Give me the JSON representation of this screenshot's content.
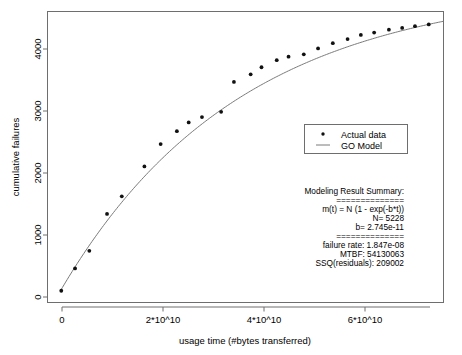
{
  "chart_data": {
    "type": "scatter",
    "title": "",
    "xlabel": "usage time (#bytes transferred)",
    "ylabel": "cumulative failures",
    "xlim": [
      -2500000000,
      78000000000
    ],
    "ylim": [
      -180,
      4780
    ],
    "grid": false,
    "legend_position": "center-right",
    "xticks": [
      0,
      20000000000,
      40000000000,
      60000000000
    ],
    "xtick_labels": [
      "0",
      "2*10^10",
      "4*10^10",
      "6*10^10"
    ],
    "yticks": [
      0,
      1000,
      2000,
      3000,
      4000
    ],
    "ytick_labels": [
      "0",
      "1000",
      "2000",
      "3000",
      "4000"
    ],
    "series": [
      {
        "name": "Actual data",
        "marker": "point",
        "color": "#111111",
        "x": [
          300000000,
          3100000000,
          6000000000,
          9600000000,
          12600000000,
          17200000000,
          20500000000,
          23800000000,
          26200000000,
          28900000000,
          32800000000,
          35400000000,
          38800000000,
          41000000000,
          44100000000,
          46500000000,
          49600000000,
          52500000000,
          55500000000,
          58500000000,
          61200000000,
          63900000000,
          66900000000,
          69600000000,
          72200000000,
          75000000000
        ],
        "y": [
          20,
          400,
          700,
          1330,
          1630,
          2140,
          2520,
          2740,
          2890,
          2980,
          3070,
          3580,
          3710,
          3830,
          3950,
          4010,
          4050,
          4150,
          4240,
          4310,
          4380,
          4420,
          4470,
          4500,
          4530,
          4560
        ]
      },
      {
        "name": "GO Model",
        "marker": "line",
        "color": "#7a7a7a",
        "equation": "m(t) = N * (1 - exp(-b*t))",
        "N": 5228,
        "b": 2.745e-11
      }
    ]
  },
  "legend": {
    "entries": [
      {
        "label": "Actual data",
        "symbol": "point"
      },
      {
        "label": "GO Model",
        "symbol": "line"
      }
    ]
  },
  "summary": {
    "heading": "Modeling Result Summary:",
    "rule_top": "==============",
    "equation": "m(t) = N (1 - exp(-b*t))",
    "n_value": "N= 5228",
    "b_value": "b= 2.745e-11",
    "rule_mid": "==============",
    "failure_rate": "failure rate: 1.847e-08",
    "mtbf": "MTBF: 54130063",
    "ssq": "SSQ(residuals): 209002"
  }
}
